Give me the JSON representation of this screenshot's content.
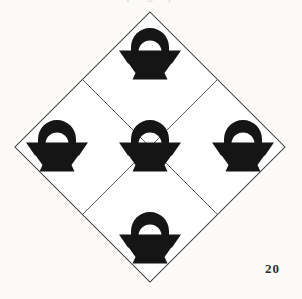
{
  "page": {
    "background_color": "#fbfaf7",
    "ink_color": "#151515",
    "line_color": "#4a4a4a",
    "ghost_running_head": "p t g t p",
    "figure_number": "20"
  },
  "plate": {
    "title": "Basket Quilt Block",
    "shape": "diamond",
    "center": {
      "x": 150,
      "y": 147
    },
    "half_diagonal": 135,
    "lattice": {
      "rows": 2,
      "cols": 2,
      "cell_half_diagonal": 67.5,
      "visible": true
    },
    "motif_name": "basket",
    "motif_count": 5,
    "motif_arrangement": "quincunx",
    "motifs": [
      {
        "id": "basket-top",
        "label": "top basket",
        "cx": 150,
        "cy": 55,
        "scale": 1.0
      },
      {
        "id": "basket-left",
        "label": "left basket",
        "cx": 57,
        "cy": 147,
        "scale": 1.0
      },
      {
        "id": "basket-center",
        "label": "center basket",
        "cx": 150,
        "cy": 147,
        "scale": 1.0
      },
      {
        "id": "basket-right",
        "label": "right basket",
        "cx": 243,
        "cy": 147,
        "scale": 1.0
      },
      {
        "id": "basket-bottom",
        "label": "bottom basket",
        "cx": 150,
        "cy": 239,
        "scale": 1.0
      }
    ]
  }
}
